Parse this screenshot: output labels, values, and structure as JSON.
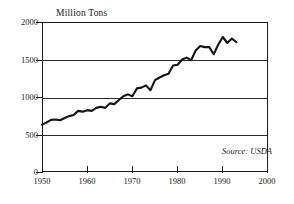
{
  "chart_data": {
    "type": "line",
    "title": "Million Tons",
    "xlabel": "",
    "ylabel": "Million Tons",
    "units": "Million Tons",
    "grid": true,
    "legend": false,
    "xlim": [
      1950,
      2000
    ],
    "ylim": [
      0,
      2000
    ],
    "xticks": [
      1950,
      1960,
      1970,
      1980,
      1990,
      2000
    ],
    "yticks": [
      0,
      500,
      1000,
      1500,
      2000
    ],
    "annotations": [
      "Source: USDA"
    ],
    "x": [
      1950,
      1951,
      1952,
      1953,
      1954,
      1955,
      1956,
      1957,
      1958,
      1959,
      1960,
      1961,
      1962,
      1963,
      1964,
      1965,
      1966,
      1967,
      1968,
      1969,
      1970,
      1971,
      1972,
      1973,
      1974,
      1975,
      1976,
      1977,
      1978,
      1979,
      1980,
      1981,
      1982,
      1983,
      1984,
      1985,
      1986,
      1987,
      1988,
      1989,
      1990,
      1991,
      1992,
      1993
    ],
    "values": [
      631,
      660,
      695,
      700,
      690,
      720,
      745,
      760,
      815,
      805,
      825,
      815,
      855,
      870,
      855,
      915,
      905,
      960,
      1010,
      1035,
      1010,
      1115,
      1125,
      1155,
      1090,
      1225,
      1260,
      1290,
      1310,
      1420,
      1430,
      1500,
      1525,
      1490,
      1620,
      1680,
      1665,
      1665,
      1570,
      1700,
      1800,
      1720,
      1780,
      1730
    ],
    "series": [
      {
        "name": "World Grain Production",
        "color": "#141414",
        "values": [
          631,
          660,
          695,
          700,
          690,
          720,
          745,
          760,
          815,
          805,
          825,
          815,
          855,
          870,
          855,
          915,
          905,
          960,
          1010,
          1035,
          1010,
          1115,
          1125,
          1155,
          1090,
          1225,
          1260,
          1290,
          1310,
          1420,
          1430,
          1500,
          1525,
          1490,
          1620,
          1680,
          1665,
          1665,
          1570,
          1700,
          1800,
          1720,
          1780,
          1730
        ]
      }
    ]
  },
  "axis": {
    "y_labels": [
      "2000",
      "1500",
      "1000",
      "500",
      "0"
    ],
    "x_labels": [
      "1950",
      "1960",
      "1970",
      "1980",
      "1990",
      "2000"
    ],
    "top_title": "Million Tons"
  },
  "source": {
    "text": "Source: USDA"
  }
}
